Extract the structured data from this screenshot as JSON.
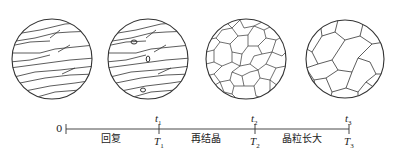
{
  "diagram": {
    "stages": [
      {
        "id": "deformed",
        "description": "elongated deformed grains"
      },
      {
        "id": "recovery",
        "description": "deformed grains with nuclei"
      },
      {
        "id": "recrystallized",
        "description": "fine equiaxed grains"
      },
      {
        "id": "grain-growth",
        "description": "coarse equiaxed grains"
      }
    ],
    "timeline": {
      "origin": "0",
      "phases": [
        "回复",
        "再结晶",
        "晶粒长大"
      ],
      "ticks": [
        {
          "t": "t",
          "t_sub": "1",
          "T": "T",
          "T_sub": "1"
        },
        {
          "t": "t",
          "t_sub": "2",
          "T": "T",
          "T_sub": "2"
        },
        {
          "t": "t",
          "t_sub": "3",
          "T": "T",
          "T_sub": "3"
        }
      ]
    },
    "colors": {
      "line": "#333333",
      "background": "#ffffff"
    }
  }
}
